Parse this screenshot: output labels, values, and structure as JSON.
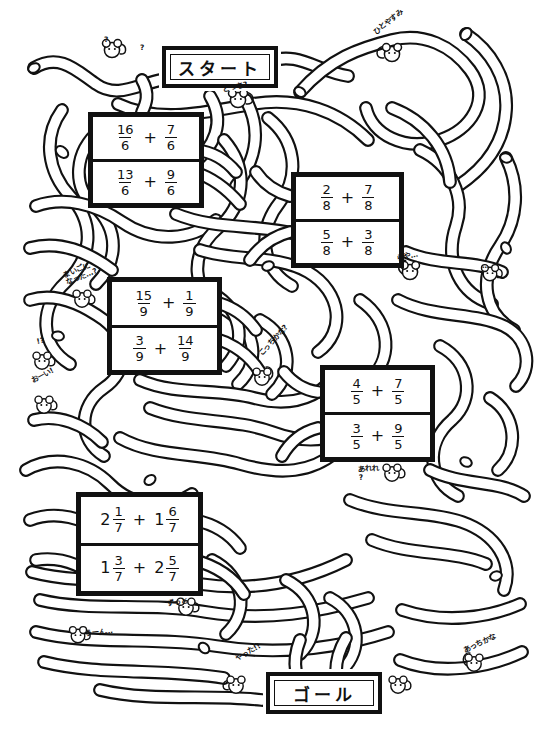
{
  "worksheet": {
    "type": "fraction-addition-maze",
    "start_label": "スタート",
    "goal_label": "ゴール",
    "background_color": "#ffffff",
    "ink_color": "#111111"
  },
  "markers": {
    "start": {
      "label": "スタート",
      "x": 162,
      "y": 46,
      "w": 108,
      "h": 34
    },
    "goal": {
      "label": "ゴール",
      "x": 266,
      "y": 672,
      "w": 108,
      "h": 34
    }
  },
  "problems": [
    {
      "id": "problem-1",
      "x": 88,
      "y": 112,
      "w": 106,
      "h": 86,
      "rows": [
        {
          "left": {
            "whole": "",
            "num": "16",
            "den": "6"
          },
          "op": "+",
          "right": {
            "whole": "",
            "num": "7",
            "den": "6"
          }
        },
        {
          "left": {
            "whole": "",
            "num": "13",
            "den": "6"
          },
          "op": "+",
          "right": {
            "whole": "",
            "num": "9",
            "den": "6"
          }
        }
      ]
    },
    {
      "id": "problem-2",
      "x": 291,
      "y": 172,
      "w": 103,
      "h": 86,
      "rows": [
        {
          "left": {
            "whole": "",
            "num": "2",
            "den": "8"
          },
          "op": "+",
          "right": {
            "whole": "",
            "num": "7",
            "den": "8"
          }
        },
        {
          "left": {
            "whole": "",
            "num": "5",
            "den": "8"
          },
          "op": "+",
          "right": {
            "whole": "",
            "num": "3",
            "den": "8"
          }
        }
      ]
    },
    {
      "id": "problem-3",
      "x": 107,
      "y": 277,
      "w": 105,
      "h": 88,
      "rows": [
        {
          "left": {
            "whole": "",
            "num": "15",
            "den": "9"
          },
          "op": "+",
          "right": {
            "whole": "",
            "num": "1",
            "den": "9"
          }
        },
        {
          "left": {
            "whole": "",
            "num": "3",
            "den": "9"
          },
          "op": "+",
          "right": {
            "whole": "",
            "num": "14",
            "den": "9"
          }
        }
      ]
    },
    {
      "id": "problem-4",
      "x": 320,
      "y": 365,
      "w": 105,
      "h": 87,
      "rows": [
        {
          "left": {
            "whole": "",
            "num": "4",
            "den": "5"
          },
          "op": "+",
          "right": {
            "whole": "",
            "num": "7",
            "den": "5"
          }
        },
        {
          "left": {
            "whole": "",
            "num": "3",
            "den": "5"
          },
          "op": "+",
          "right": {
            "whole": "",
            "num": "9",
            "den": "5"
          }
        }
      ]
    },
    {
      "id": "problem-5",
      "x": 76,
      "y": 492,
      "w": 117,
      "h": 94,
      "rows": [
        {
          "left": {
            "whole": "2",
            "num": "1",
            "den": "7"
          },
          "op": "+",
          "right": {
            "whole": "1",
            "num": "6",
            "den": "7"
          }
        },
        {
          "left": {
            "whole": "1",
            "num": "3",
            "den": "7"
          },
          "op": "+",
          "right": {
            "whole": "2",
            "num": "5",
            "den": "7"
          }
        }
      ]
    }
  ],
  "annotations": [
    {
      "id": "anno-question-top-left",
      "text": "?",
      "x": 104,
      "y": 36,
      "rot": 0,
      "vertical": false
    },
    {
      "id": "anno-question-top-left-2",
      "text": "?",
      "x": 140,
      "y": 44,
      "rot": 0,
      "vertical": false
    },
    {
      "id": "anno-dotchi",
      "text": "どっち?",
      "x": 222,
      "y": 86,
      "rot": -12,
      "vertical": false
    },
    {
      "id": "anno-hitoyasumi",
      "text": "ひとやすみ",
      "x": 372,
      "y": 30,
      "rot": -38,
      "vertical": false
    },
    {
      "id": "anno-maigo",
      "text": "まいごに\nなった…?",
      "x": 62,
      "y": 272,
      "rot": -22,
      "vertical": false
    },
    {
      "id": "anno-question-left",
      "text": "!?",
      "x": 36,
      "y": 338,
      "rot": -10,
      "vertical": false
    },
    {
      "id": "anno-ooi",
      "text": "おーい!",
      "x": 30,
      "y": 378,
      "rot": -28,
      "vertical": false
    },
    {
      "id": "anno-kotchikana",
      "text": "こっちかな?",
      "x": 258,
      "y": 352,
      "rot": -48,
      "vertical": false
    },
    {
      "id": "anno-arare",
      "text": "あれれ\n?",
      "x": 358,
      "y": 466,
      "rot": -4,
      "vertical": false
    },
    {
      "id": "anno-zutto",
      "text": "ずっと",
      "x": 166,
      "y": 600,
      "rot": -8,
      "vertical": false
    },
    {
      "id": "anno-uun",
      "text": "うーん…",
      "x": 84,
      "y": 630,
      "rot": -6,
      "vertical": false
    },
    {
      "id": "anno-yatta",
      "text": "やった!!",
      "x": 234,
      "y": 656,
      "rot": -30,
      "vertical": false
    },
    {
      "id": "anno-atchikana",
      "text": "あっちかな",
      "x": 462,
      "y": 648,
      "rot": -26,
      "vertical": false
    },
    {
      "id": "anno-mouse-right-1",
      "text": "らや…",
      "x": 396,
      "y": 255,
      "rot": -12,
      "vertical": false
    },
    {
      "id": "anno-mouse-right-2",
      "text": "…",
      "x": 482,
      "y": 262,
      "rot": 0,
      "vertical": false
    }
  ]
}
